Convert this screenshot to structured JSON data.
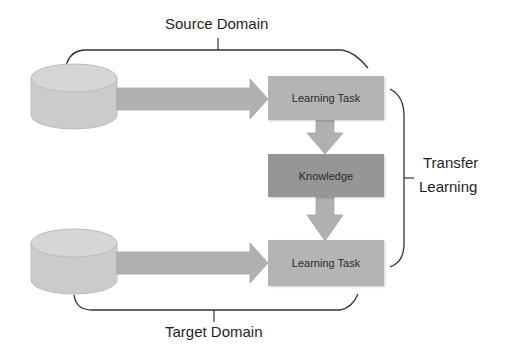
{
  "diagram": {
    "title_top": "Source Domain",
    "title_bottom": "Target Domain",
    "side_label_line1": "Transfer",
    "side_label_line2": "Learning",
    "nodes": {
      "source_db": "source-database",
      "target_db": "target-database",
      "source_task": "Learning Task",
      "knowledge": "Knowledge",
      "target_task": "Learning Task"
    },
    "colors": {
      "db_fill": "#cfcfcf",
      "arrow_fill": "#b0b0b0",
      "task_fill": "#b4b4b4",
      "knowledge_fill": "#969696",
      "bracket_stroke": "#333333"
    }
  }
}
